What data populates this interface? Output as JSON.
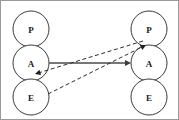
{
  "diagram": {
    "background_color": "#ffffff",
    "border_color": "#9a9a9a",
    "node_fill": "#ffffff",
    "node_stroke": "#3b3b3b",
    "solid_edge_color": "#4a4a4a",
    "dashed_edge_color": "#2e2e2e",
    "columns": [
      {
        "id": "left-column",
        "name": "left-stack",
        "nodes": [
          {
            "id": "left-p",
            "label": "P",
            "cx": 30,
            "cy": 28,
            "r": 18
          },
          {
            "id": "left-a",
            "label": "A",
            "cx": 30,
            "cy": 62,
            "r": 18
          },
          {
            "id": "left-e",
            "label": "E",
            "cx": 30,
            "cy": 96,
            "r": 18
          }
        ]
      },
      {
        "id": "right-column",
        "name": "right-stack",
        "nodes": [
          {
            "id": "right-p",
            "label": "P",
            "cx": 148,
            "cy": 28,
            "r": 18
          },
          {
            "id": "right-a",
            "label": "A",
            "cx": 148,
            "cy": 62,
            "r": 18
          },
          {
            "id": "right-e",
            "label": "E",
            "cx": 148,
            "cy": 96,
            "r": 18
          }
        ]
      }
    ],
    "edges": [
      {
        "id": "edge-a-to-a",
        "name": "solid-edge-left-a-to-right-a",
        "style": "solid",
        "from": "left-a",
        "to": "right-a",
        "x1": 48,
        "y1": 62,
        "x2": 130,
        "y2": 62,
        "arrow_at": "end"
      },
      {
        "id": "edge-p-to-ae",
        "name": "dashed-edge-right-p-to-left-junction",
        "style": "dashed",
        "from": "right-p",
        "to": "left-a",
        "x1": 142,
        "y1": 40,
        "x2": 34,
        "y2": 73,
        "arrow_at": "end"
      },
      {
        "id": "edge-e-to-p",
        "name": "dashed-edge-left-e-to-right-p",
        "style": "dashed",
        "from": "left-e",
        "to": "right-p",
        "x1": 47,
        "y1": 93,
        "x2": 145,
        "y2": 44,
        "arrow_at": "end"
      }
    ]
  }
}
